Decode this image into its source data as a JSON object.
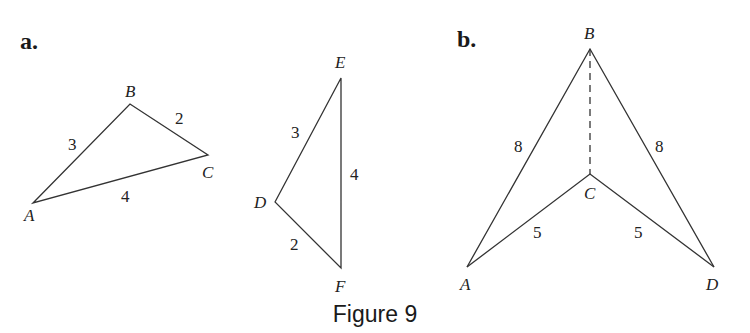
{
  "figure": {
    "caption": "Figure 9",
    "parts": {
      "a": {
        "label": "a.",
        "triangle1": {
          "vertices": {
            "A": "A",
            "B": "B",
            "C": "C"
          },
          "sides": {
            "AB": "3",
            "BC": "2",
            "AC": "4"
          }
        },
        "triangle2": {
          "vertices": {
            "D": "D",
            "E": "E",
            "F": "F"
          },
          "sides": {
            "DE": "3",
            "EF": "4",
            "DF": "2"
          }
        }
      },
      "b": {
        "label": "b.",
        "vertices": {
          "A": "A",
          "B": "B",
          "C": "C",
          "D": "D"
        },
        "sides": {
          "AB": "8",
          "BD": "8",
          "AC": "5",
          "CD": "5"
        },
        "dashed_segment": "BC"
      }
    }
  }
}
